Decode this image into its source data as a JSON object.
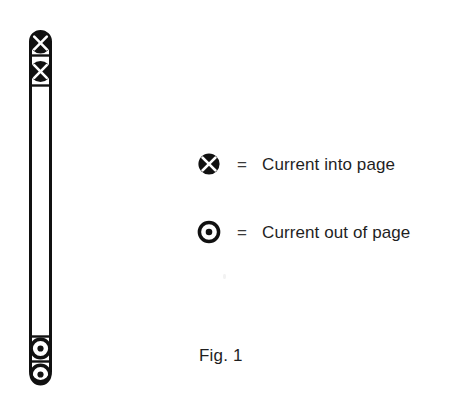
{
  "figure": {
    "caption": "Fig. 1",
    "conductor": {
      "name": "vertical-conductor-bar",
      "outline_color": "#111111",
      "fill_color": "#ffffff"
    },
    "symbols": [
      {
        "type": "current-into-page",
        "glyph": "circle-cross",
        "position": "top-1"
      },
      {
        "type": "current-into-page",
        "glyph": "circle-cross",
        "position": "top-2"
      },
      {
        "type": "current-out-of-page",
        "glyph": "circle-dot",
        "position": "bottom-1"
      },
      {
        "type": "current-out-of-page",
        "glyph": "circle-dot",
        "position": "bottom-2"
      }
    ]
  },
  "legend": {
    "equals_sign": "=",
    "items": [
      {
        "symbol_name": "current-into-page-icon",
        "glyph": "circle-cross",
        "label": "Current into page"
      },
      {
        "symbol_name": "current-out-of-page-icon",
        "glyph": "circle-dot",
        "label": "Current out of page"
      }
    ]
  },
  "colors": {
    "ink": "#111111",
    "text": "#1f1f1f",
    "background": "#ffffff"
  }
}
